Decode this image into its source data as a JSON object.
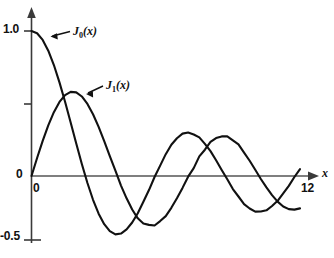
{
  "chart_data": {
    "type": "line",
    "title": "",
    "subtitle": "",
    "xlabel": "x",
    "ylabel": "",
    "xlim": [
      0,
      12
    ],
    "ylim": [
      -0.5,
      1.0
    ],
    "grid": false,
    "legend_position": "inline-annotations",
    "x_ticks": [
      {
        "value": 0,
        "label": "0"
      },
      {
        "value": 12,
        "label": "12"
      }
    ],
    "y_ticks": [
      {
        "value": 1.0,
        "label": "1.0"
      },
      {
        "value": 0.5,
        "label": ""
      },
      {
        "value": 0.0,
        "label": "0"
      },
      {
        "value": -0.5,
        "label": "-0.5"
      }
    ],
    "annotations": [
      {
        "name": "J0-callout",
        "text_main": "J",
        "text_sub": "0",
        "text_tail": "(x)",
        "points_to_x": 1.5,
        "points_to_y": 0.93
      },
      {
        "name": "J1-callout",
        "text_main": "J",
        "text_sub": "1",
        "text_tail": "(x)",
        "points_to_x": 3.2,
        "points_to_y": 0.55
      }
    ],
    "series": [
      {
        "name": "J0(x)",
        "x": [
          0,
          0.25,
          0.5,
          0.75,
          1,
          1.25,
          1.5,
          1.75,
          2,
          2.25,
          2.5,
          2.75,
          3,
          3.25,
          3.5,
          3.75,
          4,
          4.25,
          4.5,
          4.75,
          5,
          5.25,
          5.5,
          5.75,
          6,
          6.25,
          6.5,
          6.75,
          7,
          7.25,
          7.5,
          7.75,
          8,
          8.25,
          8.5,
          8.75,
          9,
          9.25,
          9.5,
          9.75,
          10,
          10.25,
          10.5,
          10.75,
          11,
          11.25,
          11.5,
          11.75,
          12
        ],
        "values": [
          1,
          0.9844,
          0.9385,
          0.8642,
          0.7652,
          0.6459,
          0.5118,
          0.369,
          0.2239,
          0.0827,
          -0.0484,
          -0.1641,
          -0.2601,
          -0.3325,
          -0.3801,
          -0.4026,
          -0.3971,
          -0.3686,
          -0.3205,
          -0.2566,
          -0.1776,
          -0.0968,
          -0.0068,
          0.0717,
          0.1506,
          0.2159,
          0.2601,
          0.2921,
          0.3001,
          0.2865,
          0.2663,
          0.2211,
          0.1717,
          0.1085,
          0.0419,
          -0.0226,
          -0.0903,
          -0.1414,
          -0.1939,
          -0.2243,
          -0.2459,
          -0.2453,
          -0.2366,
          -0.2069,
          -0.1712,
          -0.1201,
          -0.0677,
          -0.0068,
          0.0477
        ]
      },
      {
        "name": "J1(x)",
        "x": [
          0,
          0.25,
          0.5,
          0.75,
          1,
          1.25,
          1.5,
          1.75,
          2,
          2.25,
          2.5,
          2.75,
          3,
          3.25,
          3.5,
          3.75,
          4,
          4.25,
          4.5,
          4.75,
          5,
          5.25,
          5.5,
          5.75,
          6,
          6.25,
          6.5,
          6.75,
          7,
          7.25,
          7.5,
          7.75,
          8,
          8.25,
          8.5,
          8.75,
          9,
          9.25,
          9.5,
          9.75,
          10,
          10.25,
          10.5,
          10.75,
          11,
          11.25,
          11.5,
          11.75,
          12
        ],
        "values": [
          0,
          0.124,
          0.2423,
          0.3492,
          0.4401,
          0.5106,
          0.5579,
          0.5802,
          0.5767,
          0.5484,
          0.4971,
          0.4256,
          0.3391,
          0.2404,
          0.1374,
          0.0366,
          -0.066,
          -0.1538,
          -0.2311,
          -0.2919,
          -0.3276,
          -0.3371,
          -0.3414,
          -0.311,
          -0.2767,
          -0.2196,
          -0.1538,
          -0.0819,
          -0.0047,
          0.0543,
          0.1352,
          0.1813,
          0.2346,
          0.2616,
          0.2731,
          0.2731,
          0.2453,
          0.2178,
          0.1613,
          0.1051,
          0.0435,
          -0.021,
          -0.0789,
          -0.1321,
          -0.1768,
          -0.2099,
          -0.2284,
          -0.232,
          -0.2234
        ]
      }
    ]
  },
  "axis": {
    "x_name": "x",
    "origin_label": "0",
    "x_end_label": "12",
    "y_top_label": "1.0",
    "y_zero_label": "0",
    "y_bottom_label": "-0.5"
  },
  "labels": {
    "j0": {
      "base": "J",
      "sub": "0",
      "arg": "(x)"
    },
    "j1": {
      "base": "J",
      "sub": "1",
      "arg": "(x)"
    }
  },
  "colors": {
    "curve": "#111111",
    "axis": "#555555",
    "text": "#111111",
    "background": "#ffffff"
  }
}
